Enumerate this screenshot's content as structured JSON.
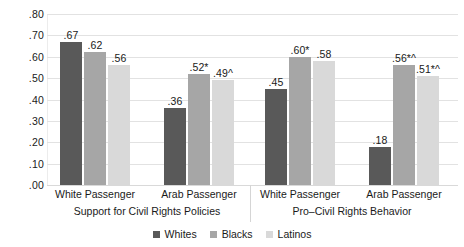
{
  "chart_data": {
    "type": "bar",
    "title": "",
    "xlabel": "",
    "ylabel": "",
    "ylim": [
      0.0,
      0.8
    ],
    "grid": true,
    "legend_position": "bottom-center",
    "ytick_labels": [
      ".80",
      ".70",
      ".60",
      ".50",
      ".40",
      ".30",
      ".20",
      ".10",
      ".00"
    ],
    "ytick_values": [
      0.8,
      0.7,
      0.6,
      0.5,
      0.4,
      0.3,
      0.2,
      0.1,
      0.0
    ],
    "series": [
      {
        "name": "Whites",
        "color": "#595959",
        "values": [
          0.67,
          0.36,
          0.45,
          0.18
        ]
      },
      {
        "name": "Blacks",
        "color": "#a6a6a6",
        "values": [
          0.62,
          0.52,
          0.6,
          0.56
        ]
      },
      {
        "name": "Latinos",
        "color": "#d9d9d9",
        "values": [
          0.56,
          0.49,
          0.58,
          0.51
        ]
      }
    ],
    "categories": [
      "White Passenger",
      "Arab Passenger",
      "White Passenger",
      "Arab Passenger"
    ],
    "panels": [
      {
        "label": "Support for Civil Rights Policies",
        "categories": [
          0,
          1
        ]
      },
      {
        "label": "Pro–Civil Rights Behavior",
        "categories": [
          2,
          3
        ]
      }
    ],
    "bar_labels": [
      [
        ".67",
        ".36",
        ".45",
        ".18"
      ],
      [
        ".62",
        ".52*",
        ".60*",
        ".56*^"
      ],
      [
        ".56",
        ".49^",
        ".58",
        ".51*^"
      ]
    ],
    "annotations": {
      "significance_markers": [
        "*",
        "^"
      ]
    }
  },
  "legend": {
    "items": [
      {
        "label": "Whites",
        "color": "#595959"
      },
      {
        "label": "Blacks",
        "color": "#a6a6a6"
      },
      {
        "label": "Latinos",
        "color": "#d9d9d9"
      }
    ]
  }
}
